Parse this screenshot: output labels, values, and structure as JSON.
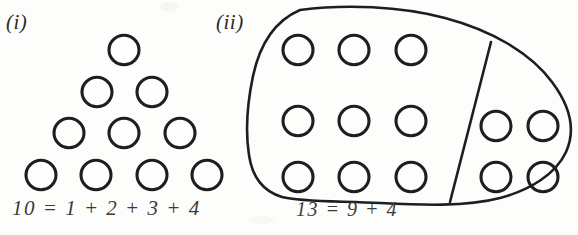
{
  "figure": {
    "background_color": "#fdfdfb",
    "ink_color": "#1e1e1e",
    "text_color": "#3a3a3a",
    "width": 578,
    "height": 235,
    "panels": [
      {
        "label": "(i)",
        "label_name": "panel-label-i",
        "caption": "10 = 1 + 2 + 3 + 4",
        "arrangement": "triangular",
        "total": 10,
        "row_counts": [
          1,
          2,
          3,
          4
        ],
        "circle_radius": 15,
        "circles": [
          {
            "cx": 124,
            "cy": 50
          },
          {
            "cx": 97,
            "cy": 92
          },
          {
            "cx": 152,
            "cy": 92
          },
          {
            "cx": 69,
            "cy": 133
          },
          {
            "cx": 124,
            "cy": 133
          },
          {
            "cx": 180,
            "cy": 133
          },
          {
            "cx": 41,
            "cy": 175
          },
          {
            "cx": 96,
            "cy": 175
          },
          {
            "cx": 152,
            "cy": 175
          },
          {
            "cx": 207,
            "cy": 175
          }
        ]
      },
      {
        "label": "(ii)",
        "label_name": "panel-label-ii",
        "caption": "13 = 9 + 4",
        "arrangement": "partitioned-blob",
        "total": 13,
        "left_group_count": 9,
        "right_group_count": 4,
        "circle_radius": 15,
        "blob_outline": "M 300 10 C 345 4 400 6 445 18 C 490 30 530 52 552 82 C 570 106 576 130 566 152 C 556 174 530 190 500 198 C 466 207 420 205 380 203 C 340 201 300 202 282 197 C 262 191 252 176 249 155 C 245 130 248 100 253 76 C 259 48 272 22 300 10 Z",
        "divider_line": {
          "x1": 491,
          "y1": 42,
          "x2": 450,
          "y2": 202
        },
        "left_circles": [
          {
            "cx": 298,
            "cy": 50
          },
          {
            "cx": 354,
            "cy": 50
          },
          {
            "cx": 411,
            "cy": 50
          },
          {
            "cx": 298,
            "cy": 121
          },
          {
            "cx": 354,
            "cy": 121
          },
          {
            "cx": 411,
            "cy": 121
          },
          {
            "cx": 298,
            "cy": 177
          },
          {
            "cx": 354,
            "cy": 177
          },
          {
            "cx": 411,
            "cy": 177
          }
        ],
        "right_circles": [
          {
            "cx": 496,
            "cy": 126
          },
          {
            "cx": 543,
            "cy": 126
          },
          {
            "cx": 496,
            "cy": 177
          },
          {
            "cx": 543,
            "cy": 177
          }
        ]
      }
    ]
  }
}
